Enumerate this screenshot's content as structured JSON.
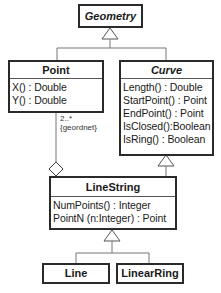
{
  "diagram": {
    "type": "UML class diagram",
    "classes": {
      "geometry": {
        "name": "Geometry",
        "abstract": true,
        "operations": []
      },
      "point": {
        "name": "Point",
        "abstract": false,
        "operations": [
          "X() : Double",
          "Y() : Double"
        ]
      },
      "curve": {
        "name": "Curve",
        "abstract": true,
        "operations": [
          "Length() : Double",
          "StartPoint() : Point",
          "EndPoint() : Point",
          "IsClosed():Boolean",
          "IsRing() : Boolean"
        ]
      },
      "linestring": {
        "name": "LineString",
        "abstract": false,
        "operations": [
          "NumPoints() : Integer",
          "PointN (n:Integer) : Point"
        ]
      },
      "line": {
        "name": "Line",
        "abstract": false,
        "operations": []
      },
      "linearring": {
        "name": "LinearRing",
        "abstract": false,
        "operations": []
      }
    },
    "relations": {
      "aggregation": {
        "from": "LineString",
        "to": "Point",
        "multiplicity": "2..*",
        "constraint": "{geordnet}"
      },
      "generalizations": [
        {
          "child": "Point",
          "parent": "Geometry"
        },
        {
          "child": "Curve",
          "parent": "Geometry"
        },
        {
          "child": "LineString",
          "parent": "Curve"
        },
        {
          "child": "Line",
          "parent": "LineString"
        },
        {
          "child": "LinearRing",
          "parent": "LineString"
        }
      ]
    }
  }
}
